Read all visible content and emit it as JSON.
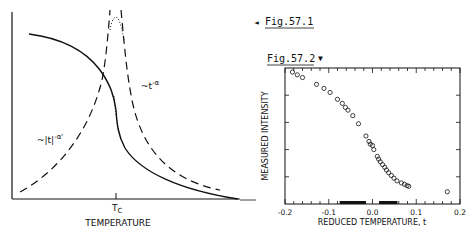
{
  "figure_refs": {
    "fig1": {
      "label": "Fig.57.1",
      "arrow": "◄"
    },
    "fig2": {
      "label": "Fig.57.2",
      "arrow": "▼"
    }
  },
  "chart_data": [
    {
      "type": "line",
      "title": "",
      "xlabel": "TEMPERATURE",
      "ylabel": "",
      "x_tick_labels": [
        "T_c"
      ],
      "grid": false,
      "annotations": [
        "~|t|^-α'",
        "~t^-α"
      ],
      "series": [
        {
          "name": "solid curve (order parameter-like, decreasing through Tc)",
          "style": "solid"
        },
        {
          "name": "~|t|^-α' (below Tc)",
          "style": "dashed"
        },
        {
          "name": "~t^-α (above Tc)",
          "style": "dashed"
        },
        {
          "name": "rounded peak near Tc",
          "style": "dotted"
        }
      ],
      "labels": {
        "tc": "T",
        "tc_sub": "C",
        "xlabel": "TEMPERATURE",
        "ann_left": "~|t|",
        "ann_left_exp": "-α'",
        "ann_right": "~t",
        "ann_right_exp": "-α"
      }
    },
    {
      "type": "scatter",
      "title": "",
      "xlabel": "REDUCED TEMPERATURE, t",
      "ylabel": "MEASURED INTENSITY",
      "xlim": [
        -0.2,
        0.2
      ],
      "x_ticks": [
        -0.2,
        -0.1,
        0.0,
        0.1,
        0.2
      ],
      "x_tick_labels": [
        "-0.2",
        "-0.1",
        "0.0",
        "0.1",
        "0.2"
      ],
      "ylim": [
        0,
        1
      ],
      "y_units": "arbitrary (normalized 0 = axis bottom, 1 = axis top)",
      "grid": false,
      "marker": "open circle",
      "bars_on_axis": [
        {
          "from": -0.075,
          "to": -0.015
        },
        {
          "from": 0.015,
          "to": 0.057
        }
      ],
      "x": [
        -0.183,
        -0.172,
        -0.16,
        -0.128,
        -0.111,
        -0.097,
        -0.08,
        -0.069,
        -0.062,
        -0.056,
        -0.045,
        -0.032,
        -0.015,
        -0.008,
        -0.005,
        0.0,
        0.003,
        0.011,
        0.014,
        0.018,
        0.023,
        0.028,
        0.032,
        0.037,
        0.043,
        0.049,
        0.056,
        0.066,
        0.073,
        0.079,
        0.083,
        0.171
      ],
      "y": [
        0.97,
        0.95,
        0.93,
        0.88,
        0.85,
        0.82,
        0.77,
        0.74,
        0.71,
        0.69,
        0.65,
        0.59,
        0.5,
        0.46,
        0.44,
        0.43,
        0.4,
        0.35,
        0.33,
        0.31,
        0.29,
        0.27,
        0.25,
        0.23,
        0.21,
        0.19,
        0.17,
        0.155,
        0.145,
        0.135,
        0.13,
        0.09
      ],
      "labels": {
        "xlabel": "REDUCED TEMPERATURE, t",
        "ylabel": "MEASURED INTENSITY"
      }
    }
  ]
}
